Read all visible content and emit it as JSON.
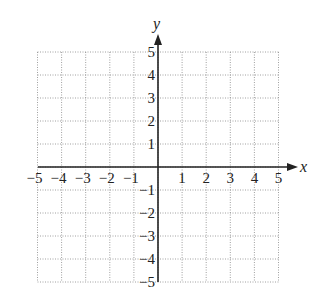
{
  "chart_data": {
    "type": "scatter",
    "title": "",
    "xlabel": "x",
    "ylabel": "y",
    "xlim": [
      -5,
      5
    ],
    "ylim": [
      -5,
      5
    ],
    "grid": true,
    "grid_style": "dotted",
    "x_ticks": [
      "−5",
      "−4",
      "−3",
      "−2",
      "−1",
      "1",
      "2",
      "3",
      "4",
      "5"
    ],
    "y_ticks": [
      "5",
      "4",
      "3",
      "2",
      "1",
      "−1",
      "−2",
      "−3",
      "−4",
      "−5"
    ],
    "series": []
  }
}
